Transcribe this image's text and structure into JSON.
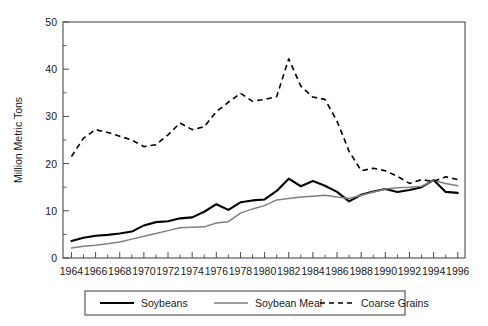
{
  "chart_data": {
    "type": "line",
    "title": "",
    "xlabel": "",
    "ylabel": "Million Metric Tons",
    "xlim": [
      1963.3,
      1996.6
    ],
    "ylim": [
      0,
      50
    ],
    "yticks": [
      0,
      10,
      20,
      30,
      40,
      50
    ],
    "yticklabels": [
      "0",
      "10",
      "20",
      "30",
      "40",
      "50"
    ],
    "y_minor_interval": 5,
    "xticks": [
      1964,
      1966,
      1968,
      1970,
      1972,
      1974,
      1976,
      1978,
      1980,
      1982,
      1984,
      1986,
      1988,
      1990,
      1992,
      1994,
      1996
    ],
    "xticklabels": [
      "1964",
      "1966",
      "1968",
      "1970",
      "1972",
      "1974",
      "1976",
      "1978",
      "1980",
      "1982",
      "1984",
      "1986",
      "1988",
      "1990",
      "1992",
      "1994",
      "1996"
    ],
    "x_minor_interval": 1,
    "grid": false,
    "legend_position": "bottom-outside",
    "x": [
      1964,
      1965,
      1966,
      1967,
      1968,
      1969,
      1970,
      1971,
      1972,
      1973,
      1974,
      1975,
      1976,
      1977,
      1978,
      1979,
      1980,
      1981,
      1982,
      1983,
      1984,
      1985,
      1986,
      1987,
      1988,
      1989,
      1990,
      1991,
      1992,
      1993,
      1994,
      1995,
      1996
    ],
    "series": [
      {
        "name": "Soybeans",
        "style": "solid",
        "color": "#000000",
        "values": [
          3.6,
          4.3,
          4.7,
          4.9,
          5.2,
          5.6,
          6.9,
          7.6,
          7.8,
          8.4,
          8.6,
          9.8,
          11.4,
          10.2,
          11.8,
          12.2,
          12.4,
          14.2,
          16.8,
          15.2,
          16.3,
          15.3,
          14.0,
          12.0,
          13.4,
          14.1,
          14.6,
          14.0,
          14.4,
          15.0,
          16.5,
          14.0,
          13.8
        ]
      },
      {
        "name": "Soybean Meal",
        "style": "solid",
        "color": "#808080",
        "values": [
          2.1,
          2.5,
          2.7,
          3.0,
          3.4,
          4.0,
          4.6,
          5.2,
          5.8,
          6.4,
          6.5,
          6.6,
          7.4,
          7.7,
          9.5,
          10.4,
          11.1,
          12.3,
          12.6,
          12.9,
          13.1,
          13.3,
          12.9,
          12.6,
          13.3,
          14.0,
          14.6,
          14.9,
          15.0,
          15.2,
          16.4,
          15.8,
          15.3
        ]
      },
      {
        "name": "Coarse Grains",
        "style": "dashed",
        "color": "#000000",
        "values": [
          21.5,
          25.4,
          27.2,
          26.6,
          25.8,
          25.0,
          23.6,
          24.0,
          26.1,
          28.6,
          27.2,
          27.8,
          31.0,
          33.0,
          34.9,
          33.2,
          33.6,
          34.2,
          42.2,
          36.4,
          34.1,
          33.6,
          29.0,
          22.6,
          18.5,
          19.0,
          18.5,
          17.3,
          15.8,
          16.6,
          16.2,
          17.2,
          16.6
        ]
      }
    ],
    "legend": [
      {
        "label": "Soybeans",
        "style": "solid",
        "color": "#000000"
      },
      {
        "label": "Soybean Meal",
        "style": "solid",
        "color": "#808080"
      },
      {
        "label": "Coarse Grains",
        "style": "dashed",
        "color": "#000000"
      }
    ]
  }
}
